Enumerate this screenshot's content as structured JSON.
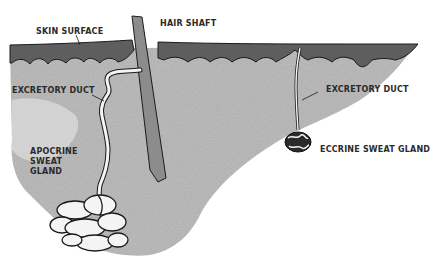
{
  "diagram": {
    "colors": {
      "epidermis": "#5e5e5e",
      "dermis": "#b9b9b9",
      "hair": "#8c8c8c",
      "gland": "#f4f4f4",
      "ink": "#1a1a1a"
    },
    "labels": {
      "skin_surface": "SKIN SURFACE",
      "hair_shaft": "HAIR SHAFT",
      "excretory_duct_left": "EXCRETORY DUCT",
      "excretory_duct_right": "EXCRETORY DUCT",
      "apocrine_line1": "APOCRINE",
      "apocrine_line2": "SWEAT",
      "apocrine_line3": "GLAND",
      "eccrine": "ECCRINE SWEAT GLAND"
    }
  }
}
